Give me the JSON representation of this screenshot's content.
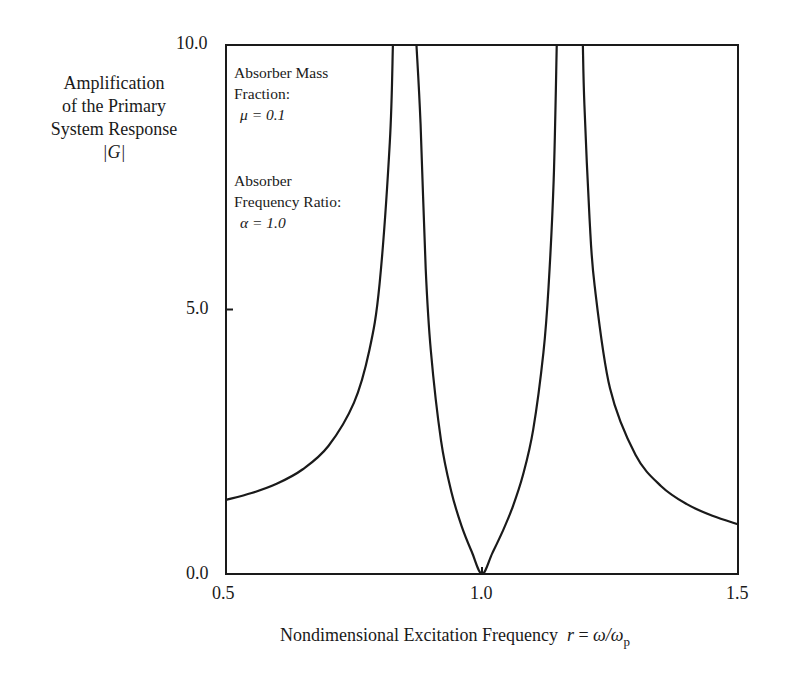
{
  "chart_data": {
    "type": "line",
    "title": "",
    "xlabel": "Nondimensional Excitation Frequency  r = ω/ωp",
    "ylabel": "Amplification of the Primary System Response |G|",
    "xlim": [
      0.5,
      1.5
    ],
    "ylim": [
      0.0,
      10.0
    ],
    "grid": false,
    "x_ticks": [
      "0.5",
      "1.0",
      "1.5"
    ],
    "y_ticks": [
      "0.0",
      "5.0",
      "10.0"
    ],
    "annotations": [
      "Absorber Mass Fraction: μ = 0.1",
      "Absorber Frequency Ratio: α = 1.0"
    ],
    "series": [
      {
        "name": "|G| (branch below first resonance)",
        "x": [
          0.5,
          0.55,
          0.6,
          0.65,
          0.7,
          0.75,
          0.78,
          0.8,
          0.82,
          0.826
        ],
        "y": [
          1.4,
          1.53,
          1.71,
          1.98,
          2.42,
          3.24,
          4.23,
          5.49,
          8.17,
          10.0
        ]
      },
      {
        "name": "|G| (branch between resonances)",
        "x": [
          0.872,
          0.88,
          0.89,
          0.9,
          0.92,
          0.94,
          0.96,
          0.98,
          1.0,
          1.02,
          1.04,
          1.06,
          1.08,
          1.1,
          1.12,
          1.13,
          1.14,
          1.146
        ],
        "y": [
          10.0,
          8.51,
          5.78,
          4.23,
          2.52,
          1.56,
          0.91,
          0.42,
          0.0,
          0.39,
          0.8,
          1.27,
          1.87,
          2.73,
          4.19,
          5.43,
          7.45,
          10.0
        ]
      },
      {
        "name": "|G| (branch above second resonance)",
        "x": [
          1.197,
          1.2,
          1.21,
          1.22,
          1.25,
          1.3,
          1.35,
          1.4,
          1.45,
          1.5
        ],
        "y": [
          10.0,
          8.87,
          6.73,
          5.45,
          3.51,
          2.25,
          1.66,
          1.32,
          1.1,
          0.94
        ]
      }
    ]
  },
  "labels": {
    "ylabel_line1": "Amplification",
    "ylabel_line2": "of the Primary",
    "ylabel_line3": "System Response",
    "ylabel_symbol": "|G|",
    "ann_mass_line1": "Absorber Mass",
    "ann_mass_line2": "Fraction:",
    "ann_mass_value": "μ = 0.1",
    "ann_freq_line1": "Absorber",
    "ann_freq_line2": "Frequency Ratio:",
    "ann_freq_value": "α = 1.0",
    "xlabel_text": "Nondimensional Excitation Frequency",
    "xlabel_r": "r",
    "xlabel_eq": " = ",
    "xlabel_omega": "ω/ω",
    "xlabel_sub": "p",
    "ytick_top": "10.0",
    "ytick_mid": "5.0",
    "ytick_bot": "0.0",
    "xtick_left": "0.5",
    "xtick_mid": "1.0",
    "xtick_right": "1.5"
  }
}
